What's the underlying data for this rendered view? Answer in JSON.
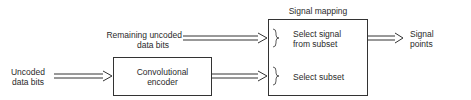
{
  "diagram": {
    "inputs": {
      "remaining": {
        "line1": "Remaining uncoded",
        "line2": "data bits"
      },
      "uncoded": {
        "line1": "Uncoded",
        "line2": "data bits"
      }
    },
    "encoder": {
      "line1": "Convolutional",
      "line2": "encoder"
    },
    "mapper": {
      "title": "Signal mapping",
      "select_signal": {
        "line1": "Select signal",
        "line2": "from subset"
      },
      "select_subset": "Select subset"
    },
    "output": {
      "line1": "Signal",
      "line2": "points"
    },
    "colors": {
      "stroke": "#333333",
      "text": "#2a2a2a",
      "background": "#ffffff"
    }
  }
}
